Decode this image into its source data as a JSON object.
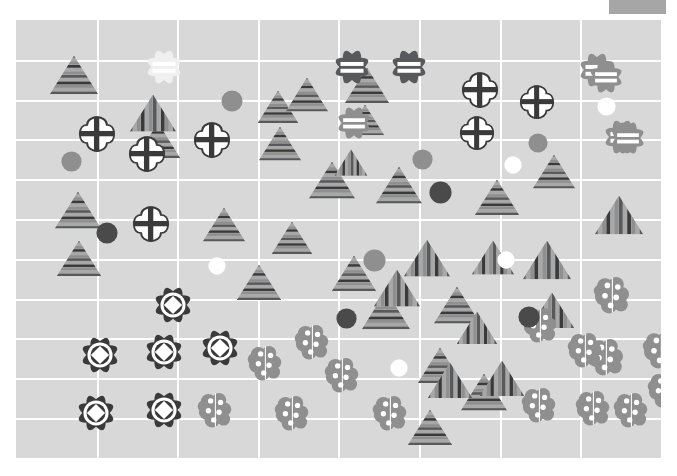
{
  "figure": {
    "title": "",
    "background_color": "#ffffff",
    "plot_background_color": "#d8d8d8",
    "grid_color": "#ffffff",
    "plot_rect": {
      "x": 16,
      "y": 20,
      "width": 645,
      "height": 438
    },
    "grid": {
      "show": true,
      "v_step": 80.6,
      "h_step": 39.8
    },
    "legend_swatch": {
      "x": 609,
      "y": 0,
      "width": 57,
      "height": 14,
      "color": "#a6a6a6"
    }
  },
  "palette": {
    "plot_bg": "#d8d8d8",
    "grid": "#ffffff",
    "gray_mid": "#8f8f8f",
    "gray_dark": "#58595b",
    "gray_darker": "#4a4a4a",
    "near_black": "#3a3a3a",
    "white": "#ffffff",
    "pale": "#f0f0f0",
    "stripe_light": "#a8a8a8",
    "stripe_dark": "#6e6e6e"
  },
  "marker_types": {
    "tri_h": "triangle-horizontal-stripes",
    "tri_v": "triangle-vertical-stripes",
    "cross_clover": "clover-with-cross",
    "flower_bars": "flower-with-equal-bars",
    "flower_diamond": "flower-with-diamond",
    "cluster_dots": "cluster-with-dots",
    "circle_solid": "solid-circle",
    "circle_white": "white-circle"
  },
  "chart_data": {
    "type": "scatter",
    "title": "",
    "xlabel": "",
    "ylabel": "",
    "xlim": [
      0,
      645
    ],
    "ylim": [
      0,
      438
    ],
    "grid": true,
    "legend": "none",
    "series": [
      {
        "name": "triangle-horizontal-stripes",
        "marker": "tri_h",
        "count": 22,
        "points": [
          {
            "x": 58,
            "y": 55,
            "size": 50,
            "shade": "mid"
          },
          {
            "x": 142,
            "y": 120,
            "size": 46,
            "shade": "mid"
          },
          {
            "x": 262,
            "y": 87,
            "size": 42,
            "shade": "mid"
          },
          {
            "x": 264,
            "y": 124,
            "size": 44,
            "shade": "mid"
          },
          {
            "x": 291,
            "y": 75,
            "size": 44,
            "shade": "mid"
          },
          {
            "x": 351,
            "y": 65,
            "size": 46,
            "shade": "mid"
          },
          {
            "x": 349,
            "y": 100,
            "size": 40,
            "shade": "mid"
          },
          {
            "x": 316,
            "y": 160,
            "size": 48,
            "shade": "mid"
          },
          {
            "x": 383,
            "y": 165,
            "size": 48,
            "shade": "mid"
          },
          {
            "x": 481,
            "y": 177,
            "size": 46,
            "shade": "mid"
          },
          {
            "x": 538,
            "y": 152,
            "size": 44,
            "shade": "mid"
          },
          {
            "x": 62,
            "y": 190,
            "size": 48,
            "shade": "mid"
          },
          {
            "x": 63,
            "y": 238,
            "size": 46,
            "shade": "mid"
          },
          {
            "x": 208,
            "y": 205,
            "size": 44,
            "shade": "mid"
          },
          {
            "x": 276,
            "y": 218,
            "size": 42,
            "shade": "mid"
          },
          {
            "x": 243,
            "y": 262,
            "size": 46,
            "shade": "mid"
          },
          {
            "x": 338,
            "y": 253,
            "size": 46,
            "shade": "mid"
          },
          {
            "x": 370,
            "y": 290,
            "size": 50,
            "shade": "mid"
          },
          {
            "x": 441,
            "y": 285,
            "size": 48,
            "shade": "mid"
          },
          {
            "x": 424,
            "y": 345,
            "size": 46,
            "shade": "mid"
          },
          {
            "x": 468,
            "y": 372,
            "size": 48,
            "shade": "mid"
          },
          {
            "x": 414,
            "y": 407,
            "size": 46,
            "shade": "mid"
          }
        ]
      },
      {
        "name": "triangle-vertical-stripes",
        "marker": "tri_v",
        "count": 11,
        "points": [
          {
            "x": 137,
            "y": 93,
            "size": 48
          },
          {
            "x": 603,
            "y": 195,
            "size": 50
          },
          {
            "x": 335,
            "y": 143,
            "size": 34
          },
          {
            "x": 411,
            "y": 238,
            "size": 48
          },
          {
            "x": 531,
            "y": 240,
            "size": 50
          },
          {
            "x": 477,
            "y": 238,
            "size": 44
          },
          {
            "x": 381,
            "y": 268,
            "size": 48
          },
          {
            "x": 536,
            "y": 290,
            "size": 46
          },
          {
            "x": 461,
            "y": 308,
            "size": 42
          },
          {
            "x": 434,
            "y": 360,
            "size": 46
          },
          {
            "x": 486,
            "y": 358,
            "size": 46
          }
        ]
      },
      {
        "name": "clover-with-cross",
        "marker": "cross_clover",
        "count": 7,
        "points": [
          {
            "x": 81,
            "y": 114,
            "size": 38
          },
          {
            "x": 131,
            "y": 134,
            "size": 38
          },
          {
            "x": 196,
            "y": 120,
            "size": 38
          },
          {
            "x": 135,
            "y": 204,
            "size": 38
          },
          {
            "x": 464,
            "y": 70,
            "size": 38
          },
          {
            "x": 521,
            "y": 82,
            "size": 36
          },
          {
            "x": 461,
            "y": 113,
            "size": 36
          }
        ]
      },
      {
        "name": "flower-with-equal-bars",
        "marker": "flower_bars",
        "count": 8,
        "points": [
          {
            "x": 148,
            "y": 47,
            "size": 36,
            "shade": "pale"
          },
          {
            "x": 336,
            "y": 47,
            "size": 36,
            "shade": "dark"
          },
          {
            "x": 393,
            "y": 47,
            "size": 36,
            "shade": "dark"
          },
          {
            "x": 581,
            "y": 50,
            "size": 36,
            "shade": "mid"
          },
          {
            "x": 606,
            "y": 117,
            "size": 36,
            "shade": "mid"
          },
          {
            "x": 338,
            "y": 103,
            "size": 34,
            "shade": "mid"
          },
          {
            "x": 590,
            "y": 57,
            "size": 34,
            "shade": "mid"
          },
          {
            "x": 612,
            "y": 118,
            "size": 34,
            "shade": "mid"
          }
        ]
      },
      {
        "name": "flower-with-diamond",
        "marker": "flower_diamond",
        "count": 6,
        "points": [
          {
            "x": 157,
            "y": 285,
            "size": 38
          },
          {
            "x": 84,
            "y": 335,
            "size": 38
          },
          {
            "x": 148,
            "y": 332,
            "size": 38
          },
          {
            "x": 204,
            "y": 328,
            "size": 38
          },
          {
            "x": 80,
            "y": 393,
            "size": 38
          },
          {
            "x": 148,
            "y": 390,
            "size": 38
          }
        ]
      },
      {
        "name": "cluster-with-dots",
        "marker": "cluster_dots",
        "count": 13,
        "points": [
          {
            "x": 597,
            "y": 275,
            "size": 40
          },
          {
            "x": 591,
            "y": 337,
            "size": 40
          },
          {
            "x": 646,
            "y": 330,
            "size": 40
          },
          {
            "x": 250,
            "y": 343,
            "size": 38
          },
          {
            "x": 297,
            "y": 322,
            "size": 38
          },
          {
            "x": 327,
            "y": 355,
            "size": 38
          },
          {
            "x": 525,
            "y": 305,
            "size": 38
          },
          {
            "x": 570,
            "y": 330,
            "size": 38
          },
          {
            "x": 200,
            "y": 390,
            "size": 38
          },
          {
            "x": 277,
            "y": 393,
            "size": 38
          },
          {
            "x": 375,
            "y": 393,
            "size": 38
          },
          {
            "x": 524,
            "y": 385,
            "size": 38
          },
          {
            "x": 578,
            "y": 388,
            "size": 38
          },
          {
            "x": 616,
            "y": 390,
            "size": 38
          },
          {
            "x": 650,
            "y": 370,
            "size": 38
          }
        ]
      },
      {
        "name": "solid-circle",
        "marker": "circle_solid",
        "count": 7,
        "points": [
          {
            "x": 216,
            "y": 81,
            "size": 22,
            "shade": "mid"
          },
          {
            "x": 55,
            "y": 141,
            "size": 21,
            "shade": "mid"
          },
          {
            "x": 406,
            "y": 139,
            "size": 21,
            "shade": "mid"
          },
          {
            "x": 424,
            "y": 172,
            "size": 23,
            "shade": "dark"
          },
          {
            "x": 91,
            "y": 213,
            "size": 22,
            "shade": "dark"
          },
          {
            "x": 358,
            "y": 240,
            "size": 23,
            "shade": "mid"
          },
          {
            "x": 330,
            "y": 298,
            "size": 21,
            "shade": "dark"
          },
          {
            "x": 513,
            "y": 297,
            "size": 22,
            "shade": "dark"
          },
          {
            "x": 522,
            "y": 123,
            "size": 20,
            "shade": "mid"
          }
        ]
      },
      {
        "name": "white-circle",
        "marker": "circle_white",
        "count": 5,
        "points": [
          {
            "x": 590,
            "y": 86,
            "size": 19
          },
          {
            "x": 497,
            "y": 145,
            "size": 18
          },
          {
            "x": 201,
            "y": 246,
            "size": 18
          },
          {
            "x": 490,
            "y": 240,
            "size": 18
          },
          {
            "x": 383,
            "y": 348,
            "size": 18
          }
        ]
      }
    ]
  }
}
